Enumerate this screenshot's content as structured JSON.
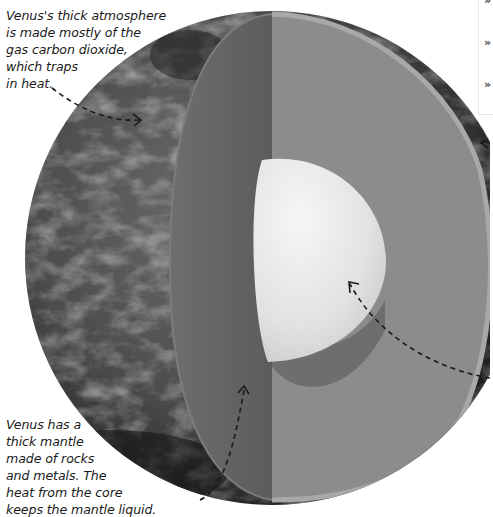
{
  "diagram": {
    "layers": [
      {
        "name": "atmosphere",
        "color": "#4a4a4a"
      },
      {
        "name": "mantle",
        "color": "#8a8a8a"
      },
      {
        "name": "core",
        "color": "#e8e8e8"
      }
    ]
  },
  "captions": {
    "atmosphere": {
      "lines": [
        "Venus's thick atmosphere",
        "is made mostly of the",
        "gas carbon dioxide,",
        "which traps",
        "in heat."
      ]
    },
    "mantle": {
      "lines": [
        "Venus has a",
        "thick mantle",
        "made of rocks",
        "and metals. The",
        "heat from the core",
        "keeps the mantle liquid."
      ]
    }
  },
  "sidebar": {
    "bullets": [
      "»",
      "»",
      "»"
    ]
  }
}
